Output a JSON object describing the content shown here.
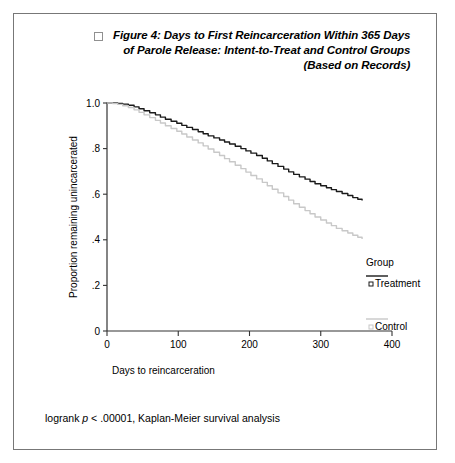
{
  "figure": {
    "marker_icon": "open-square-icon",
    "title_lines": [
      "Figure 4: Days to First Reincarceration Within 365 Days",
      "of Parole Release: Intent-to-Treat and Control Groups",
      "(Based on Records)"
    ],
    "footnote_prefix": "logrank ",
    "footnote_italic": "p",
    "footnote_suffix": " < .00001, Kaplan-Meier survival analysis"
  },
  "chart_data": {
    "type": "line",
    "title": "Figure 4: Days to First Reincarceration Within 365 Days of Parole Release: Intent-to-Treat and Control Groups (Based on Records)",
    "subtitle": "",
    "xlabel": "Days to reincarceration",
    "ylabel": "Proportion remaining unincarcerated",
    "xlim": [
      0,
      400
    ],
    "ylim": [
      0,
      1.0
    ],
    "xticks": [
      0,
      100,
      200,
      300,
      400
    ],
    "xtick_labels": [
      "0",
      "100",
      "200",
      "300",
      "400"
    ],
    "yticks": [
      0,
      0.2,
      0.4,
      0.6,
      0.8,
      1.0
    ],
    "ytick_labels": [
      "0",
      ".2",
      ".4",
      ".6",
      ".8",
      "1.0"
    ],
    "grid": false,
    "legend_title": "Group",
    "legend_position": "right",
    "series": [
      {
        "name": "Treatment",
        "color": "#1a1a1a",
        "marker": "open-square",
        "x": [
          0,
          8,
          15,
          22,
          30,
          38,
          45,
          52,
          60,
          68,
          75,
          82,
          90,
          98,
          105,
          112,
          120,
          128,
          135,
          142,
          150,
          158,
          165,
          172,
          180,
          188,
          195,
          202,
          210,
          218,
          225,
          232,
          240,
          248,
          255,
          262,
          270,
          278,
          285,
          292,
          300,
          308,
          315,
          322,
          330,
          338,
          345,
          352,
          358
        ],
        "y": [
          1.0,
          1.0,
          0.998,
          0.995,
          0.99,
          0.983,
          0.975,
          0.966,
          0.957,
          0.948,
          0.938,
          0.929,
          0.92,
          0.911,
          0.902,
          0.893,
          0.884,
          0.874,
          0.865,
          0.856,
          0.847,
          0.838,
          0.829,
          0.82,
          0.81,
          0.8,
          0.79,
          0.78,
          0.77,
          0.758,
          0.746,
          0.734,
          0.722,
          0.71,
          0.698,
          0.687,
          0.676,
          0.666,
          0.656,
          0.646,
          0.637,
          0.628,
          0.62,
          0.612,
          0.603,
          0.594,
          0.585,
          0.578,
          0.572
        ]
      },
      {
        "name": "Control",
        "color": "#c8c8c8",
        "marker": "open-square",
        "x": [
          0,
          8,
          15,
          22,
          30,
          38,
          45,
          52,
          60,
          68,
          75,
          82,
          90,
          98,
          105,
          112,
          120,
          128,
          135,
          142,
          150,
          158,
          165,
          172,
          180,
          188,
          195,
          202,
          210,
          218,
          225,
          232,
          240,
          248,
          255,
          262,
          270,
          278,
          285,
          292,
          300,
          308,
          315,
          322,
          330,
          338,
          345,
          352,
          358
        ],
        "y": [
          1.0,
          0.998,
          0.994,
          0.988,
          0.98,
          0.97,
          0.959,
          0.948,
          0.936,
          0.924,
          0.912,
          0.9,
          0.888,
          0.876,
          0.864,
          0.851,
          0.838,
          0.825,
          0.812,
          0.798,
          0.784,
          0.77,
          0.756,
          0.742,
          0.727,
          0.712,
          0.697,
          0.682,
          0.667,
          0.652,
          0.637,
          0.622,
          0.606,
          0.59,
          0.574,
          0.558,
          0.543,
          0.528,
          0.514,
          0.5,
          0.487,
          0.474,
          0.462,
          0.45,
          0.44,
          0.43,
          0.42,
          0.411,
          0.404
        ]
      }
    ]
  }
}
